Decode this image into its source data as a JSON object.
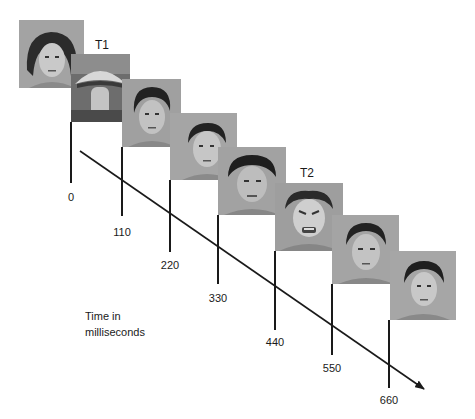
{
  "diagram": {
    "axis_label_line1": "Time in",
    "axis_label_line2": "milliseconds",
    "targets": [
      {
        "label": "T1",
        "frame_index": 1
      },
      {
        "label": "T2",
        "frame_index": 5
      }
    ],
    "frames": [
      {
        "index": 0,
        "content": "neutral face (long dark hair)",
        "time_ms": "0"
      },
      {
        "index": 1,
        "content": "mushroom photo (T1)",
        "time_ms": "110"
      },
      {
        "index": 2,
        "content": "neutral face",
        "time_ms": "220"
      },
      {
        "index": 3,
        "content": "neutral face",
        "time_ms": "330"
      },
      {
        "index": 4,
        "content": "neutral face",
        "time_ms": "440"
      },
      {
        "index": 5,
        "content": "angry face (T2)",
        "time_ms": "550"
      },
      {
        "index": 6,
        "content": "neutral face",
        "time_ms": "660"
      },
      {
        "index": 7,
        "content": "neutral face",
        "time_ms": ""
      }
    ],
    "tick_labels": [
      "0",
      "110",
      "220",
      "330",
      "440",
      "550",
      "660"
    ],
    "colors": {
      "line": "#1a1a1a",
      "photo_bg": "#9a9a9a",
      "background": "#ffffff"
    }
  }
}
